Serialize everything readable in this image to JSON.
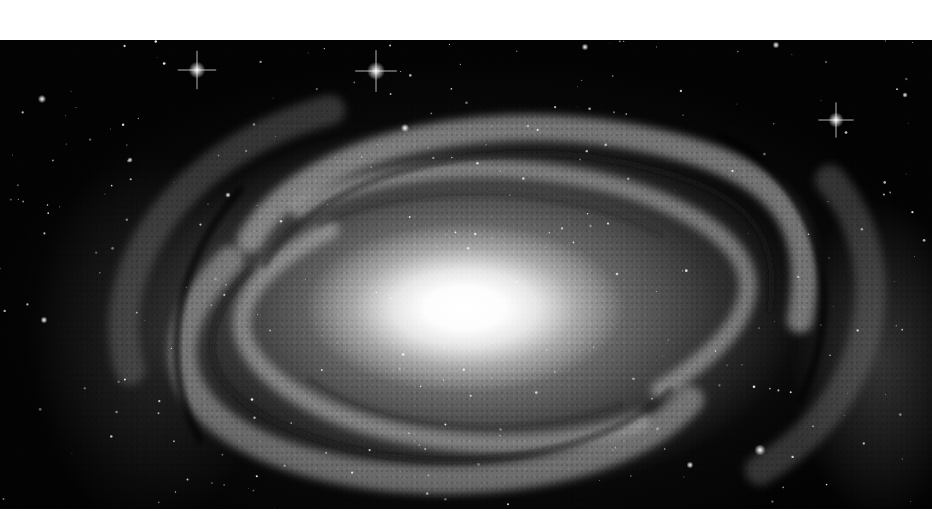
{
  "image": {
    "subject": "spiral galaxy",
    "style": "grayscale astronomical photograph",
    "colors": {
      "background_margin": "#ffffff",
      "space": "#030303",
      "core": "#ffffff",
      "arms": "#9a9a9a",
      "dust_lanes": "#1e1e1e"
    }
  }
}
